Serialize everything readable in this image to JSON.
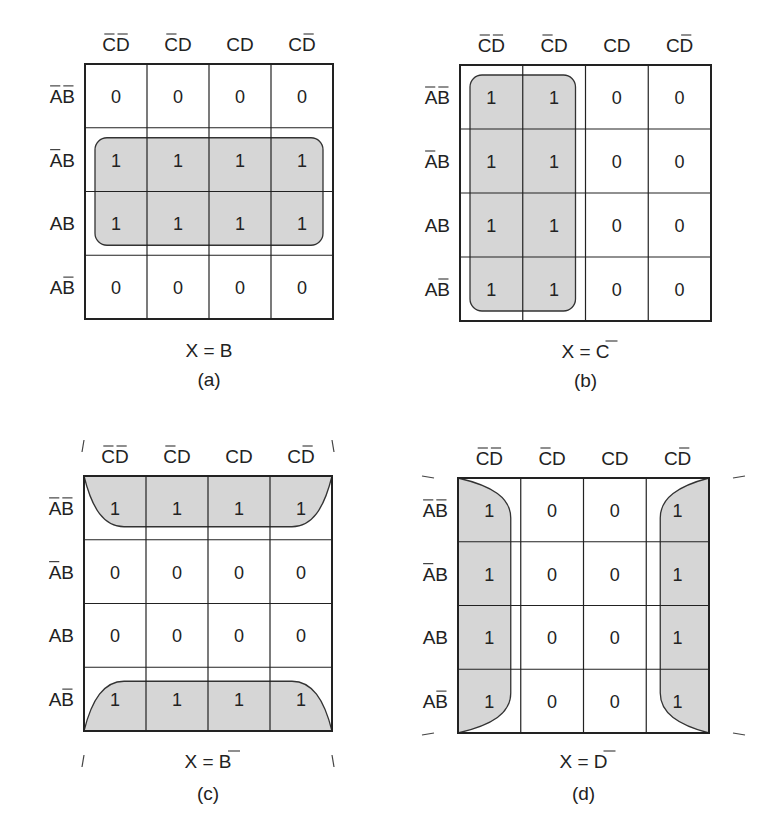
{
  "figure": {
    "col_headers": [
      {
        "text": "CD",
        "bars": [
          0,
          1
        ]
      },
      {
        "text": "CD",
        "bars": [
          0
        ]
      },
      {
        "text": "CD",
        "bars": []
      },
      {
        "text": "CD",
        "bars": [
          1
        ]
      }
    ],
    "row_headers": [
      {
        "text": "AB",
        "bars": [
          0,
          1
        ]
      },
      {
        "text": "AB",
        "bars": [
          0
        ]
      },
      {
        "text": "AB",
        "bars": []
      },
      {
        "text": "AB",
        "bars": [
          1
        ]
      }
    ],
    "maps": [
      {
        "id": "a",
        "label": "(a)",
        "equation": {
          "lhs": "X",
          "eq": "=",
          "rhs": "B",
          "rhs_bar": false
        },
        "cells": [
          [
            0,
            0,
            0,
            0
          ],
          [
            1,
            1,
            1,
            1
          ],
          [
            1,
            1,
            1,
            1
          ],
          [
            0,
            0,
            0,
            0
          ]
        ],
        "grouping": "rows 2-3 (AB̄·, AB)"
      },
      {
        "id": "b",
        "label": "(b)",
        "equation": {
          "lhs": "X",
          "eq": "=",
          "rhs": "C",
          "rhs_bar": true
        },
        "cells": [
          [
            1,
            1,
            0,
            0
          ],
          [
            1,
            1,
            0,
            0
          ],
          [
            1,
            1,
            0,
            0
          ],
          [
            1,
            1,
            0,
            0
          ]
        ],
        "grouping": "columns 1-2"
      },
      {
        "id": "c",
        "label": "(c)",
        "equation": {
          "lhs": "X",
          "eq": "=",
          "rhs": "B",
          "rhs_bar": true
        },
        "cells": [
          [
            1,
            1,
            1,
            1
          ],
          [
            0,
            0,
            0,
            0
          ],
          [
            0,
            0,
            0,
            0
          ],
          [
            1,
            1,
            1,
            1
          ]
        ],
        "grouping": "rows 1 and 4 (wrap-around)"
      },
      {
        "id": "d",
        "label": "(d)",
        "equation": {
          "lhs": "X",
          "eq": "=",
          "rhs": "D",
          "rhs_bar": true
        },
        "cells": [
          [
            1,
            0,
            0,
            1
          ],
          [
            1,
            0,
            0,
            1
          ],
          [
            1,
            0,
            0,
            1
          ],
          [
            1,
            0,
            0,
            1
          ]
        ],
        "grouping": "columns 1 and 4 (wrap-around)"
      }
    ],
    "colors": {
      "line": "#222222",
      "group_fill": "#d6d6d6",
      "group_stroke": "#333333"
    }
  }
}
